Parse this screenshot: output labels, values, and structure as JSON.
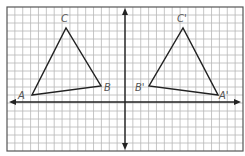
{
  "figure": {
    "width": 245,
    "height": 156,
    "colors": {
      "background": "#ffffff",
      "grid": "#b8b8b8",
      "border": "#555555",
      "axis": "#222222",
      "triangle": "#222222",
      "label": "#555555"
    },
    "grid": {
      "left": 7,
      "top": 7,
      "right": 243,
      "bottom": 151,
      "cols": 30,
      "rows": 18
    },
    "axes": {
      "x_axis_y": 102,
      "y_axis_x": 125
    }
  },
  "triangles": [
    {
      "name": "triangle-ABC",
      "vertices": [
        {
          "label": "A",
          "x": 32,
          "y": 95,
          "lx": 18,
          "ly": 99
        },
        {
          "label": "B",
          "x": 101,
          "y": 86,
          "lx": 104,
          "ly": 91
        },
        {
          "label": "C",
          "x": 66,
          "y": 28,
          "lx": 61,
          "ly": 22
        }
      ]
    },
    {
      "name": "triangle-A'B'C'",
      "vertices": [
        {
          "label": "A'",
          "x": 218,
          "y": 95,
          "lx": 219,
          "ly": 99
        },
        {
          "label": "B'",
          "x": 149,
          "y": 86,
          "lx": 135,
          "ly": 91
        },
        {
          "label": "C'",
          "x": 183,
          "y": 28,
          "lx": 177,
          "ly": 22
        }
      ]
    }
  ],
  "labels": {
    "A": "A",
    "B": "B",
    "C": "C",
    "A_prime": "A'",
    "B_prime": "B'",
    "C_prime": "C'"
  }
}
